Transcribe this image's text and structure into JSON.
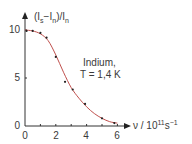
{
  "chart_data": {
    "type": "line",
    "title": "",
    "xlabel": "ν / 10¹¹s⁻¹",
    "ylabel": "(Is−In)/In",
    "xlim": [
      0,
      6.8
    ],
    "ylim": [
      0,
      11.5
    ],
    "grid": false,
    "legend": null,
    "x_ticks": [
      0,
      2,
      4,
      6
    ],
    "y_ticks": [
      0,
      5,
      10
    ],
    "annotation": [
      "Indium,",
      "T = 1,4 K"
    ],
    "series": [
      {
        "name": "measured points",
        "style": "markers",
        "color": "#222222",
        "x": [
          0.1,
          0.5,
          1.0,
          1.4,
          2.0,
          2.6,
          3.1,
          3.9,
          5.0,
          5.8
        ],
        "y": [
          9.9,
          9.9,
          9.7,
          9.2,
          7.2,
          4.6,
          3.8,
          2.3,
          0.8,
          0.3
        ]
      },
      {
        "name": "fit curve",
        "style": "line",
        "color": "#c0504d",
        "x": [
          0,
          0.5,
          1.0,
          1.5,
          2.0,
          2.5,
          3.0,
          3.5,
          4.0,
          4.5,
          5.0,
          5.5,
          6.0
        ],
        "y": [
          10.0,
          9.9,
          9.6,
          8.9,
          7.4,
          5.6,
          4.0,
          2.9,
          2.0,
          1.3,
          0.8,
          0.45,
          0.3
        ]
      }
    ]
  },
  "labels": {
    "y_axis_main": "(I",
    "y_axis_sub1": "s",
    "y_axis_mid": "−I",
    "y_axis_sub2": "n",
    "y_axis_end": ")/I",
    "y_axis_sub3": "n",
    "x_axis_main": "ν / 10",
    "x_axis_sup1": "11",
    "x_axis_s": "s",
    "x_axis_sup2": "−1",
    "x_ticks": [
      "0",
      "2",
      "4",
      "6"
    ],
    "y_ticks": [
      "0",
      "5",
      "10"
    ],
    "annot_line1": "Indium,",
    "annot_line2": "T = 1,4 K"
  }
}
